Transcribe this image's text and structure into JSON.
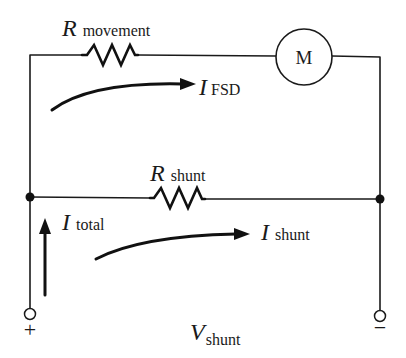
{
  "diagram": {
    "type": "circuit-schematic",
    "components": {
      "r_movement": {
        "symbol": "R",
        "subscript": "movement"
      },
      "meter": {
        "label": "M"
      },
      "r_shunt": {
        "symbol": "R",
        "subscript": "shunt"
      }
    },
    "currents": {
      "i_fsd": {
        "symbol": "I",
        "subscript": "FSD"
      },
      "i_total": {
        "symbol": "I",
        "subscript": "total"
      },
      "i_shunt": {
        "symbol": "I",
        "subscript": "shunt"
      }
    },
    "voltage": {
      "symbol": "V",
      "subscript": "shunt"
    },
    "terminals": {
      "positive": "+",
      "negative": "−"
    },
    "colors": {
      "line": "#1a1a1a",
      "background": "#ffffff"
    }
  }
}
